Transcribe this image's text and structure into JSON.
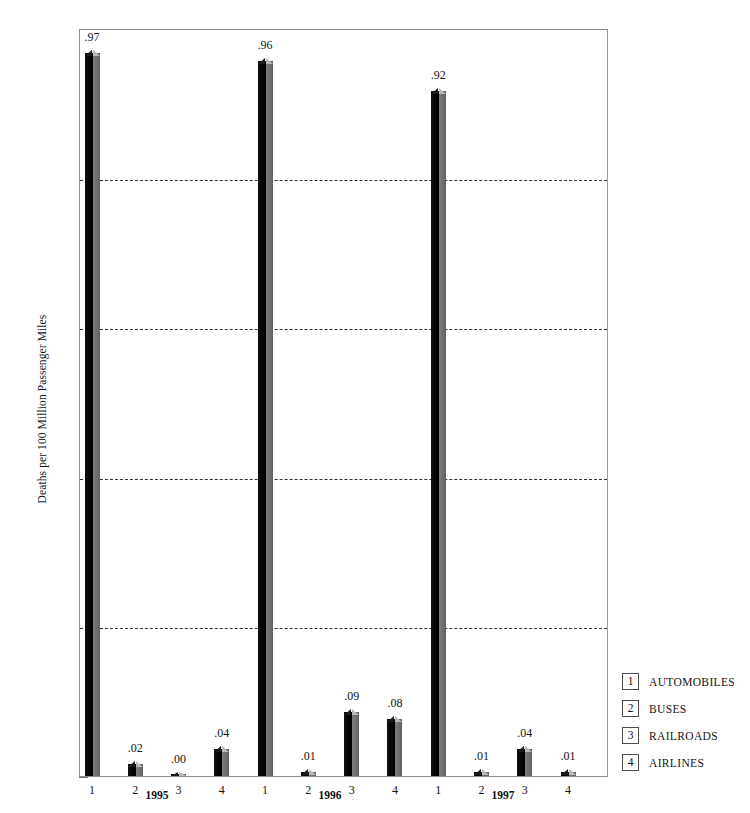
{
  "chart_data": {
    "type": "bar",
    "title": "",
    "subtitle": "",
    "xlabel": "",
    "ylabel": "Deaths per 100 Million Passenger Miles",
    "ylim": [
      0,
      1.0
    ],
    "y_ticks": [
      "1.0",
      "0.8",
      "0.6",
      "0.4",
      "0.2",
      "0"
    ],
    "y_tick_values": [
      1.0,
      0.8,
      0.6,
      0.4,
      0.2,
      0
    ],
    "grid": "horizontal-dashed",
    "gridline_values": [
      0.8,
      0.6,
      0.4,
      0.2
    ],
    "legend_position": "right-bottom",
    "categories": [
      "1995",
      "1996",
      "1997"
    ],
    "series": [
      {
        "name": "AUTOMOBILES",
        "key": "1",
        "values": [
          0.97,
          0.96,
          0.92
        ],
        "labels": [
          ".97",
          ".96",
          ".92"
        ]
      },
      {
        "name": "BUSES",
        "key": "2",
        "values": [
          0.02,
          0.01,
          0.01
        ],
        "labels": [
          ".02",
          ".01",
          ".01"
        ]
      },
      {
        "name": "RAILROADS",
        "key": "3",
        "values": [
          0.0,
          0.09,
          0.04
        ],
        "labels": [
          ".00",
          ".09",
          ".04"
        ]
      },
      {
        "name": "AIRLINES",
        "key": "4",
        "values": [
          0.04,
          0.08,
          0.01
        ],
        "labels": [
          ".04",
          ".08",
          ".01"
        ]
      }
    ],
    "bars": [
      {
        "group": "1995",
        "key": "1",
        "series": "AUTOMOBILES",
        "value": 0.97,
        "label": ".97"
      },
      {
        "group": "1995",
        "key": "2",
        "series": "BUSES",
        "value": 0.02,
        "label": ".02"
      },
      {
        "group": "1995",
        "key": "3",
        "series": "RAILROADS",
        "value": 0.0,
        "label": ".00"
      },
      {
        "group": "1995",
        "key": "4",
        "series": "AIRLINES",
        "value": 0.04,
        "label": ".04"
      },
      {
        "group": "1996",
        "key": "1",
        "series": "AUTOMOBILES",
        "value": 0.96,
        "label": ".96"
      },
      {
        "group": "1996",
        "key": "2",
        "series": "BUSES",
        "value": 0.01,
        "label": ".01"
      },
      {
        "group": "1996",
        "key": "3",
        "series": "RAILROADS",
        "value": 0.09,
        "label": ".09"
      },
      {
        "group": "1996",
        "key": "4",
        "series": "AIRLINES",
        "value": 0.08,
        "label": ".08"
      },
      {
        "group": "1997",
        "key": "1",
        "series": "AUTOMOBILES",
        "value": 0.92,
        "label": ".92"
      },
      {
        "group": "1997",
        "key": "2",
        "series": "BUSES",
        "value": 0.01,
        "label": ".01"
      },
      {
        "group": "1997",
        "key": "3",
        "series": "RAILROADS",
        "value": 0.04,
        "label": ".04"
      },
      {
        "group": "1997",
        "key": "4",
        "series": "AIRLINES",
        "value": 0.01,
        "label": ".01"
      }
    ],
    "colors": {
      "bar_front": "#0a0a0a",
      "bar_side": "#6e6e6e",
      "bar_top": "#b9b9b9",
      "gridline": "#2e2e2e",
      "axis": "#8f8f8f",
      "text": "#141414",
      "background": "#ffffff"
    }
  },
  "legend": {
    "items": [
      {
        "key": "1",
        "label": "AUTOMOBILES"
      },
      {
        "key": "2",
        "label": "BUSES"
      },
      {
        "key": "3",
        "label": "RAILROADS"
      },
      {
        "key": "4",
        "label": "AIRLINES"
      }
    ]
  },
  "axis": {
    "y_title": "Deaths per 100 Million Passenger Miles"
  }
}
